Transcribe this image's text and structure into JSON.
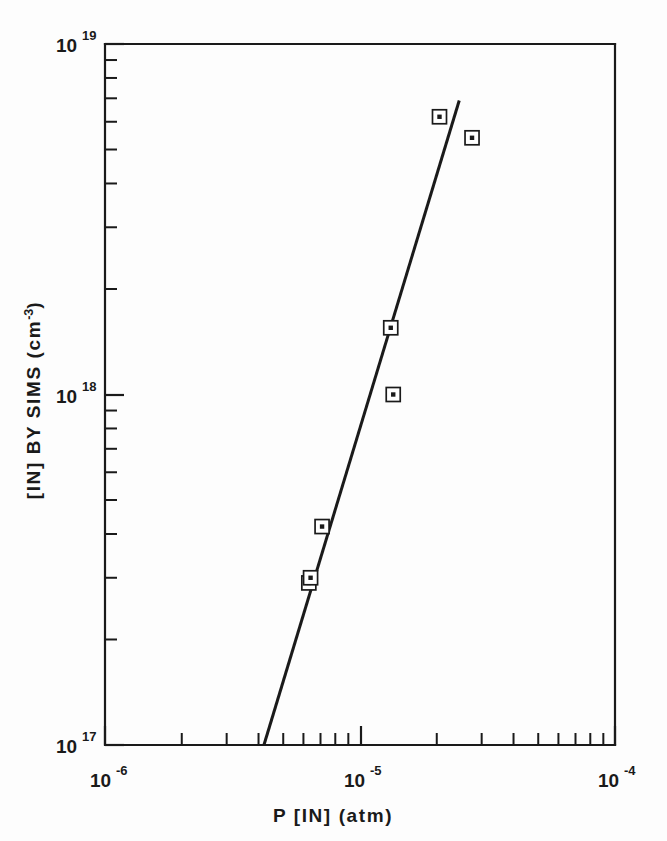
{
  "chart_data": {
    "type": "scatter",
    "title": "",
    "xlabel": "P [IN] (atm)",
    "ylabel": "[IN] BY SIMS (cm⁻³)",
    "xscale": "log",
    "yscale": "log",
    "xlim": [
      1e-06,
      0.0001
    ],
    "ylim": [
      1e+17,
      1e+19
    ],
    "grid": false,
    "legend": null,
    "x_tick_labels": [
      {
        "base": "10",
        "exp": "-6",
        "value": 1e-06
      },
      {
        "base": "10",
        "exp": "-5",
        "value": 1e-05
      },
      {
        "base": "10",
        "exp": "-4",
        "value": 0.0001
      }
    ],
    "y_tick_labels": [
      {
        "base": "10",
        "exp": "19",
        "value": 1e+19
      },
      {
        "base": "10",
        "exp": "18",
        "value": 1e+18
      },
      {
        "base": "10",
        "exp": "17",
        "value": 1e+17
      }
    ],
    "series": [
      {
        "name": "SIMS data points",
        "marker": "open-square-with-center-dot",
        "points": [
          {
            "x": 6.3e-06,
            "y": 2.9e+17
          },
          {
            "x": 6.4e-06,
            "y": 3e+17
          },
          {
            "x": 7.1e-06,
            "y": 4.2e+17
          },
          {
            "x": 1.35e-05,
            "y": 1e+18
          },
          {
            "x": 1.32e-05,
            "y": 1.55e+18
          },
          {
            "x": 2.05e-05,
            "y": 6.2e+18
          },
          {
            "x": 2.75e-05,
            "y": 5.4e+18
          }
        ]
      },
      {
        "name": "fit line",
        "marker": "none",
        "line_endpoints": [
          {
            "x": 4.2e-06,
            "y": 1e+17
          },
          {
            "x": 2.45e-05,
            "y": 6.9e+18
          }
        ]
      }
    ]
  },
  "axes": {
    "x_title": "P [IN] (atm)",
    "y_title_main": "[IN] BY SIMS (cm",
    "y_title_sup": "-3",
    "y_title_close": ")"
  }
}
